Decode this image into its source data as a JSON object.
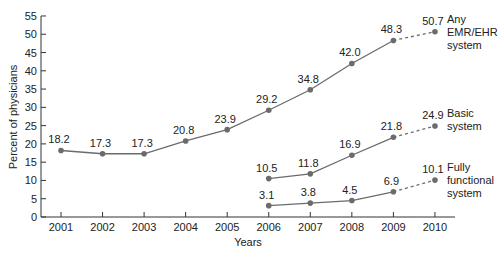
{
  "chart_data": {
    "type": "line",
    "title": "",
    "xlabel": "Years",
    "ylabel": "Percent of physicians",
    "ylim": [
      0,
      55
    ],
    "yticks": [
      0,
      5,
      10,
      15,
      20,
      25,
      30,
      35,
      40,
      45,
      50,
      55
    ],
    "x": [
      "2001",
      "2002",
      "2003",
      "2004",
      "2005",
      "2006",
      "2007",
      "2008",
      "2009",
      "2010"
    ],
    "grid": false,
    "legend_position": "inline-right",
    "series": [
      {
        "name": "Any EMR/EHR system",
        "label_lines": [
          "Any",
          "EMR/EHR",
          "system"
        ],
        "x": [
          "2001",
          "2002",
          "2003",
          "2004",
          "2005",
          "2006",
          "2007",
          "2008",
          "2009",
          "2010"
        ],
        "values": [
          18.2,
          17.3,
          17.3,
          20.8,
          23.9,
          29.2,
          34.8,
          42.0,
          48.3,
          50.7
        ],
        "labels": [
          "18.2",
          "17.3",
          "17.3",
          "20.8",
          "23.9",
          "29.2",
          "34.8",
          "42.0",
          "48.3",
          "50.7"
        ],
        "dashed_last_segment": true
      },
      {
        "name": "Basic system",
        "label_lines": [
          "Basic",
          "system"
        ],
        "x": [
          "2006",
          "2007",
          "2008",
          "2009",
          "2010"
        ],
        "values": [
          10.5,
          11.8,
          16.9,
          21.8,
          24.9
        ],
        "labels": [
          "10.5",
          "11.8",
          "16.9",
          "21.8",
          "24.9"
        ],
        "dashed_last_segment": true
      },
      {
        "name": "Fully functional system",
        "label_lines": [
          "Fully",
          "functional",
          "system"
        ],
        "x": [
          "2006",
          "2007",
          "2008",
          "2009",
          "2010"
        ],
        "values": [
          3.1,
          3.8,
          4.5,
          6.9,
          10.1
        ],
        "labels": [
          "3.1",
          "3.8",
          "4.5",
          "6.9",
          "10.1"
        ],
        "dashed_last_segment": true
      }
    ],
    "colors": {
      "line": "#6b6b6b",
      "marker": "#6b6b6b",
      "axis": "#333333",
      "text": "#222222"
    }
  }
}
